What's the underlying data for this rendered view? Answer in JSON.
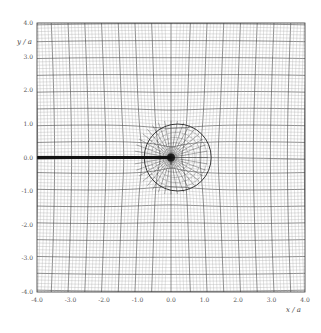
{
  "chart_data": {
    "type": "mesh",
    "title": "",
    "xlabel": "x / a",
    "ylabel": "y / a",
    "xlim": [
      -4.0,
      4.0
    ],
    "ylim": [
      -4.0,
      4.0
    ],
    "xticks": [
      "-4.0",
      "-3.0",
      "-2.0",
      "-1.0",
      "0.0",
      "1.0",
      "2.0",
      "3.0",
      "4.0"
    ],
    "yticks": [
      "4.0",
      "3.0",
      "2.0",
      "1.0",
      "0.0",
      "-1.0",
      "-2.0",
      "-3.0",
      "-4.0"
    ],
    "grid": true,
    "legend": null,
    "features": {
      "crack": {
        "x_start": -4.0,
        "x_end": 0.0,
        "y": 0.0,
        "style": "thick black line"
      },
      "process_zone_circle": {
        "center": [
          0.2,
          0.0
        ],
        "radius": 1.0
      },
      "singularity_point": [
        0.0,
        0.0
      ],
      "mesh": "curvilinear mesh, radial refinement converging at crack tip (0,0)"
    }
  }
}
